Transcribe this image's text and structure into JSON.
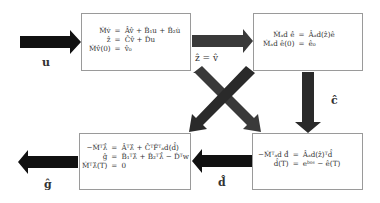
{
  "diagram": {
    "colors": {
      "arrow_black": "#111111",
      "arrow_dark": "#3a3a3a",
      "box_border": "#9a9a9a"
    },
    "boxes": [
      {
        "id": "forward-state",
        "rows": [
          {
            "lhs": "M̂v̇",
            "op": "=",
            "rhs": "Âv̂ + B̂₁u + B̂₂u̇"
          },
          {
            "lhs": "ẑ",
            "op": "=",
            "rhs": "Ĉv̂ + D̂u"
          },
          {
            "lhs": "M̂v̂(0)",
            "op": "=",
            "rhs": "v̂₀"
          }
        ]
      },
      {
        "id": "forward-adjoint-model",
        "rows": [
          {
            "lhs": "M̂ₐd ė̂",
            "op": "=",
            "rhs": "Âₐd(ẑ)ê"
          },
          {
            "lhs": "M̂ₐd ê(0)",
            "op": "=",
            "rhs": "ê₀"
          }
        ]
      },
      {
        "id": "backward-adjoint-state",
        "rows": [
          {
            "lhs": "−M̂ᵀλ̇̂",
            "op": "=",
            "rhs": "Âᵀλ̂ + ĈᵀF̂ᵀₐd(d̂)"
          },
          {
            "lhs": "ĝ",
            "op": "=",
            "rhs": "B̂₁ᵀλ̂ + B̂₂ᵀλ̇̂ − D̂ᵀw"
          },
          {
            "lhs": "M̂ᵀλ̂(T)",
            "op": "=",
            "rhs": "0"
          }
        ]
      },
      {
        "id": "backward-adjoint-model",
        "rows": [
          {
            "lhs": "−M̂ᵀₐd ḋ̂",
            "op": "=",
            "rhs": "Âₐd(ẑ)ᵀd̂"
          },
          {
            "lhs": "d̂(T)",
            "op": "=",
            "rhs": "eᵇᵒˢ − ê(T)"
          }
        ]
      }
    ],
    "labels": {
      "input": "u",
      "state_to_model": "ẑ = v̂",
      "model_to_backward": "ĉ",
      "backward_to_state": "d̂",
      "output": "ĝ"
    }
  }
}
